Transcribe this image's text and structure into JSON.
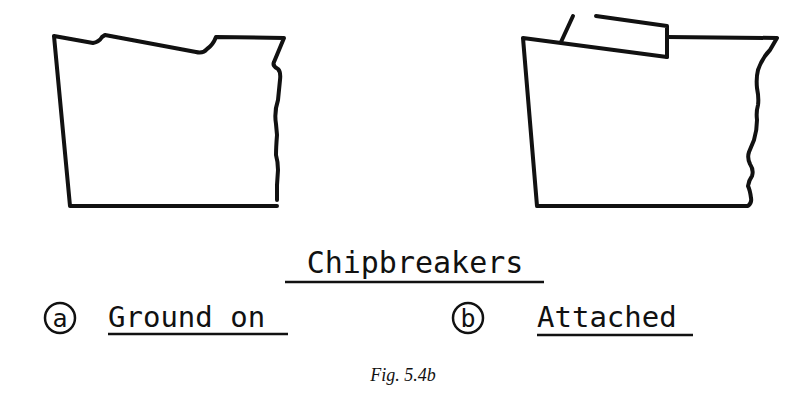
{
  "figure": {
    "title": "Chipbreakers",
    "caption": "Fig. 5.4b",
    "colors": {
      "ink": "#111111",
      "background": "#ffffff"
    }
  },
  "panels": [
    {
      "marker": "a",
      "label": "Ground on",
      "description": "Tool profile with chipbreaker groove ground into rake face"
    },
    {
      "marker": "b",
      "label": "Attached",
      "description": "Tool profile with separate chipbreaker clamped onto rake face"
    }
  ]
}
